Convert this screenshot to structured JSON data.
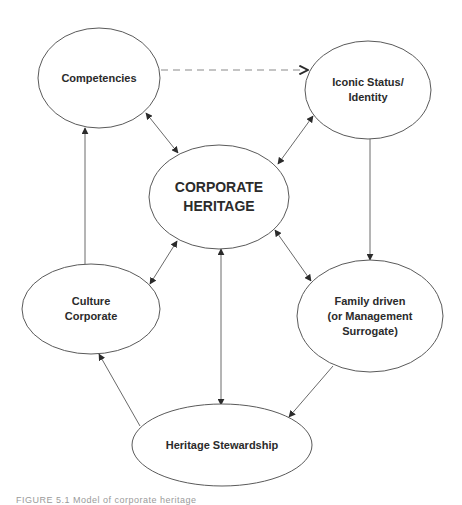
{
  "diagram": {
    "type": "flow",
    "nodes": [
      {
        "id": "competencies",
        "lines": [
          "Competencies"
        ],
        "cx": 99,
        "cy": 78,
        "rx": 61,
        "ry": 50,
        "font_size": 11
      },
      {
        "id": "iconic",
        "lines": [
          "Iconic Status/",
          "Identity"
        ],
        "cx": 368,
        "cy": 90,
        "rx": 63,
        "ry": 49,
        "font_size": 11
      },
      {
        "id": "corporate",
        "lines": [
          "CORPORATE",
          "HERITAGE"
        ],
        "cx": 219,
        "cy": 197,
        "rx": 70,
        "ry": 52,
        "font_size": 14
      },
      {
        "id": "culture",
        "lines": [
          "Culture",
          "Corporate"
        ],
        "cx": 91,
        "cy": 309,
        "rx": 69,
        "ry": 45,
        "font_size": 11
      },
      {
        "id": "family",
        "lines": [
          "Family driven",
          "(or Management",
          "Surrogate)"
        ],
        "cx": 370,
        "cy": 316,
        "rx": 73,
        "ry": 56,
        "font_size": 11
      },
      {
        "id": "stewardship",
        "lines": [
          "Heritage Stewardship"
        ],
        "cx": 222,
        "cy": 445,
        "rx": 90,
        "ry": 41,
        "font_size": 11
      }
    ],
    "edges": [
      {
        "from": "competencies",
        "to": "iconic",
        "style": "dashed",
        "direction": "forward",
        "x1": 161,
        "y1": 70,
        "x2": 308,
        "y2": 70
      },
      {
        "from": "competencies",
        "to": "corporate",
        "style": "solid",
        "direction": "both",
        "x1": 146,
        "y1": 113,
        "x2": 178,
        "y2": 153
      },
      {
        "from": "iconic",
        "to": "corporate",
        "style": "solid",
        "direction": "both",
        "x1": 313,
        "y1": 116,
        "x2": 278,
        "y2": 164
      },
      {
        "from": "iconic",
        "to": "family",
        "style": "solid",
        "direction": "forward",
        "x1": 370,
        "y1": 139,
        "x2": 370,
        "y2": 260
      },
      {
        "from": "corporate",
        "to": "culture",
        "style": "solid",
        "direction": "both",
        "x1": 177,
        "y1": 241,
        "x2": 150,
        "y2": 284
      },
      {
        "from": "corporate",
        "to": "family",
        "style": "solid",
        "direction": "both",
        "x1": 275,
        "y1": 230,
        "x2": 311,
        "y2": 281
      },
      {
        "from": "corporate",
        "to": "stewardship",
        "style": "solid",
        "direction": "both",
        "x1": 221,
        "y1": 249,
        "x2": 221,
        "y2": 405
      },
      {
        "from": "culture",
        "to": "competencies",
        "style": "solid",
        "direction": "forward",
        "x1": 85,
        "y1": 264,
        "x2": 85,
        "y2": 128
      },
      {
        "from": "family",
        "to": "stewardship",
        "style": "solid",
        "direction": "forward",
        "x1": 333,
        "y1": 366,
        "x2": 289,
        "y2": 417
      },
      {
        "from": "stewardship",
        "to": "culture",
        "style": "solid",
        "direction": "forward",
        "x1": 140,
        "y1": 426,
        "x2": 99,
        "y2": 354
      }
    ]
  },
  "caption": "FIGURE 5.1  Model of corporate heritage"
}
